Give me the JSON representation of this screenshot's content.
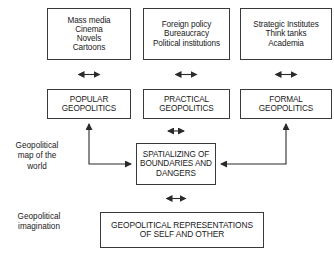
{
  "diagram": {
    "line_color": "#3a3a3a",
    "background": "#ffffff",
    "text_color": "#1a1a1a",
    "nodes": {
      "popular_sources": {
        "lines": [
          "Mass media",
          "Cinema",
          "Novels",
          "Cartoons"
        ]
      },
      "practical_sources": {
        "lines": [
          "Foreign policy",
          "Bureaucracy",
          "Political institutions"
        ]
      },
      "formal_sources": {
        "lines": [
          "Strategic Institutes",
          "Think tanks",
          "Academia"
        ]
      },
      "popular_geopolitics": {
        "lines": [
          "POPULAR",
          "GEOPOLITICS"
        ]
      },
      "practical_geopolitics": {
        "lines": [
          "PRACTICAL",
          "GEOPOLITICS"
        ]
      },
      "formal_geopolitics": {
        "lines": [
          "FORMAL",
          "GEOPOLITICS"
        ]
      },
      "spatializing": {
        "lines": [
          "SPATIALIZING OF",
          "BOUNDARIES AND",
          "DANGERS"
        ]
      },
      "representations": {
        "lines": [
          "GEOPOLITICAL REPRESENTATIONS",
          "OF SELF AND OTHER"
        ]
      }
    },
    "side_labels": {
      "geopolitical_map": {
        "lines": [
          "Geopolitical",
          "map of the",
          "world"
        ]
      },
      "geopolitical_imagination": {
        "lines": [
          "Geopolitical",
          "imagination"
        ]
      }
    },
    "connectors": [
      {
        "name": "popular-sources-to-popular-geopolitics",
        "style": "double-headed-vertical"
      },
      {
        "name": "practical-sources-to-practical-geopolitics",
        "style": "double-headed-vertical"
      },
      {
        "name": "formal-sources-to-formal-geopolitics",
        "style": "double-headed-vertical"
      },
      {
        "name": "popular-geopolitics-to-spatializing",
        "style": "double-headed-elbow-left"
      },
      {
        "name": "practical-geopolitics-to-spatializing",
        "style": "double-headed-vertical"
      },
      {
        "name": "formal-geopolitics-to-spatializing",
        "style": "double-headed-elbow-right"
      },
      {
        "name": "spatializing-to-representations",
        "style": "double-headed-vertical"
      }
    ]
  }
}
